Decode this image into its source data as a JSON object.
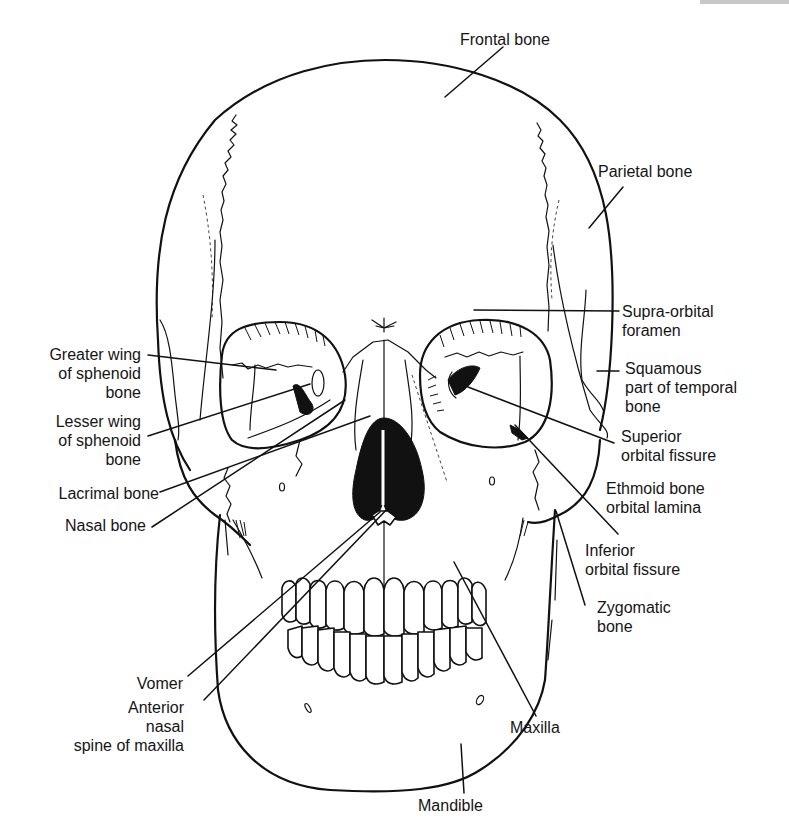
{
  "figure": {
    "line_color": "#111111",
    "background": "#ffffff"
  },
  "labels": {
    "frontal_bone": "Frontal bone",
    "parietal_bone": "Parietal bone",
    "supra_orbital_foramen": [
      "Supra-orbital",
      "foramen"
    ],
    "squamous_temporal": [
      "Squamous",
      "part of temporal",
      "bone"
    ],
    "superior_orbital_fissure": [
      "Superior",
      "orbital fissure"
    ],
    "ethmoid_orbital_lamina": [
      "Ethmoid bone",
      "orbital lamina"
    ],
    "inferior_orbital_fissure": [
      "Inferior",
      "orbital fissure"
    ],
    "zygomatic_bone": [
      "Zygomatic",
      "bone"
    ],
    "maxilla": "Maxilla",
    "mandible": "Mandible",
    "greater_wing_sphenoid": [
      "Greater wing",
      "of sphenoid",
      "bone"
    ],
    "lesser_wing_sphenoid": [
      "Lesser wing",
      "of sphenoid",
      "bone"
    ],
    "lacrimal_bone": "Lacrimal bone",
    "nasal_bone": "Nasal bone",
    "vomer": "Vomer",
    "anterior_nasal_spine": [
      "Anterior",
      "nasal",
      "spine of maxilla"
    ]
  }
}
